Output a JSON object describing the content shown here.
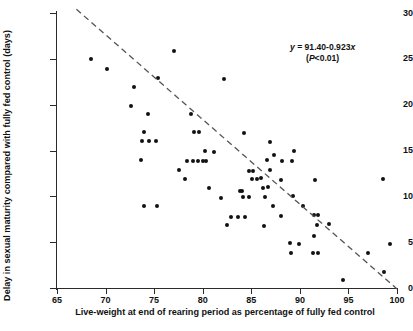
{
  "chart_data": {
    "type": "scatter",
    "title": "",
    "xlabel": "Live-weight at end of rearing period as percentage of fully fed control",
    "ylabel": "Delay in sexual maturity compared with fully fed control (days)",
    "xlim": [
      65,
      100
    ],
    "ylim": [
      0,
      30
    ],
    "xticks": [
      65,
      70,
      75,
      80,
      85,
      90,
      95,
      100
    ],
    "yticks": [
      0,
      5,
      10,
      15,
      20,
      25,
      30
    ],
    "grid": false,
    "legend": null,
    "annotations": [
      {
        "name": "regression-equation",
        "line1": "y = 91.40-0.923x",
        "line2": "(P<0.01)",
        "x": 94.5,
        "y": 27.0
      }
    ],
    "series": [
      {
        "name": "observations",
        "marker": "filled-circle",
        "color": "#121212",
        "points": [
          [
            68.5,
            25.0
          ],
          [
            70.1,
            23.9
          ],
          [
            72.9,
            21.9
          ],
          [
            72.6,
            19.9
          ],
          [
            74.4,
            19.0
          ],
          [
            77.0,
            25.9
          ],
          [
            75.4,
            22.9
          ],
          [
            82.2,
            22.8
          ],
          [
            74.0,
            17.0
          ],
          [
            73.7,
            16.0
          ],
          [
            74.5,
            16.0
          ],
          [
            75.2,
            16.0
          ],
          [
            73.6,
            14.0
          ],
          [
            78.8,
            19.0
          ],
          [
            79.1,
            17.0
          ],
          [
            79.6,
            17.0
          ],
          [
            84.2,
            16.9
          ],
          [
            80.2,
            15.0
          ],
          [
            81.2,
            14.8
          ],
          [
            86.9,
            15.9
          ],
          [
            89.4,
            14.9
          ],
          [
            77.6,
            12.9
          ],
          [
            78.4,
            13.9
          ],
          [
            79.0,
            13.9
          ],
          [
            79.5,
            13.9
          ],
          [
            80.0,
            13.9
          ],
          [
            80.3,
            13.9
          ],
          [
            86.6,
            14.0
          ],
          [
            87.3,
            14.5
          ],
          [
            88.2,
            13.9
          ],
          [
            89.2,
            13.9
          ],
          [
            86.9,
            12.9
          ],
          [
            78.2,
            11.9
          ],
          [
            80.6,
            10.9
          ],
          [
            84.8,
            12.8
          ],
          [
            85.2,
            12.8
          ],
          [
            85.1,
            11.9
          ],
          [
            85.6,
            11.9
          ],
          [
            86.0,
            12.0
          ],
          [
            88.1,
            11.8
          ],
          [
            91.6,
            11.8
          ],
          [
            98.6,
            11.9
          ],
          [
            83.8,
            10.6
          ],
          [
            84.0,
            10.6
          ],
          [
            86.7,
            11.0
          ],
          [
            86.2,
            10.9
          ],
          [
            81.9,
            9.8
          ],
          [
            84.1,
            9.9
          ],
          [
            84.8,
            9.9
          ],
          [
            86.4,
            9.9
          ],
          [
            89.3,
            10.0
          ],
          [
            73.9,
            9.0
          ],
          [
            75.3,
            9.0
          ],
          [
            87.2,
            8.9
          ],
          [
            88.1,
            7.9
          ],
          [
            90.3,
            9.0
          ],
          [
            82.9,
            7.8
          ],
          [
            83.6,
            7.8
          ],
          [
            84.3,
            7.8
          ],
          [
            91.5,
            8.0
          ],
          [
            91.9,
            8.0
          ],
          [
            82.5,
            6.9
          ],
          [
            86.3,
            6.8
          ],
          [
            91.8,
            6.9
          ],
          [
            93.0,
            7.0
          ],
          [
            91.5,
            5.7
          ],
          [
            89.0,
            4.9
          ],
          [
            89.9,
            4.8
          ],
          [
            99.3,
            4.8
          ],
          [
            89.1,
            3.8
          ],
          [
            91.3,
            3.8
          ],
          [
            91.9,
            3.8
          ],
          [
            97.0,
            3.8
          ],
          [
            98.7,
            1.8
          ],
          [
            94.4,
            0.9
          ]
        ]
      }
    ],
    "trend_line": {
      "name": "regression-line",
      "style": "dashed",
      "color": "#555555",
      "x_start": 67.0,
      "y_start": 30.4,
      "x_end": 100.0,
      "y_end": -0.1
    }
  }
}
